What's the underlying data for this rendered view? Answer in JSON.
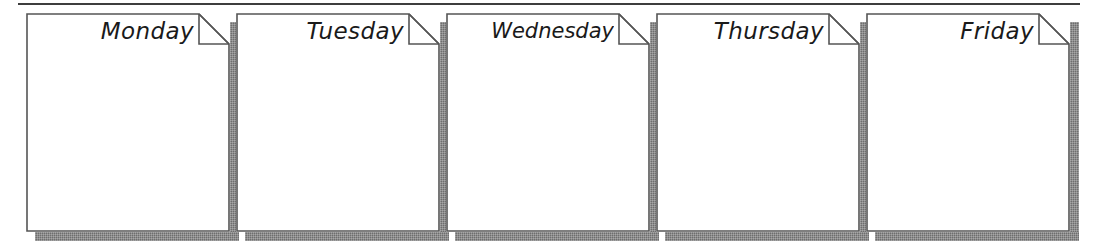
{
  "page": {
    "background_color": "#ffffff",
    "rule_color": "#3d3d3d",
    "outline_color": "#555555",
    "shadow_color": "#6e6e6e",
    "text_color": "#1a1a1a"
  },
  "divider": {
    "name": "top-horizontal-rule"
  },
  "cards": [
    {
      "label": "Monday",
      "note_text": ""
    },
    {
      "label": "Tuesday",
      "note_text": ""
    },
    {
      "label": "Wednesday",
      "note_text": ""
    },
    {
      "label": "Thursday",
      "note_text": ""
    },
    {
      "label": "Friday",
      "note_text": ""
    }
  ]
}
